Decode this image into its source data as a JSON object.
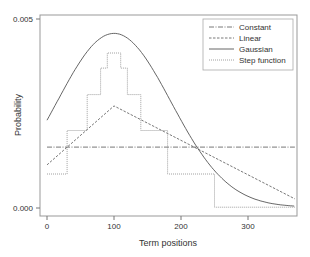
{
  "chart_data": {
    "type": "line",
    "title": "",
    "xlabel": "Term positions",
    "ylabel": "Probability",
    "xlim": [
      -10,
      370
    ],
    "ylim": [
      -0.0002,
      0.0051
    ],
    "xticks": [
      0,
      100,
      200,
      300
    ],
    "xtick_labels": [
      "0",
      "100",
      "200",
      "300"
    ],
    "yticks": [
      0.0,
      0.005
    ],
    "ytick_labels": [
      "0.000",
      "0.005"
    ],
    "grid": false,
    "legend_position": "upper right",
    "series": [
      {
        "name": "Constant",
        "style": "dashdot",
        "color": "#555555",
        "x": [
          0,
          370
        ],
        "y": [
          0.00161,
          0.00161
        ]
      },
      {
        "name": "Linear",
        "style": "dashed",
        "color": "#555555",
        "x": [
          0,
          100,
          370
        ],
        "y": [
          0.00114,
          0.0027,
          0.00024
        ]
      },
      {
        "name": "Gaussian",
        "style": "solid",
        "color": "#555555",
        "mean": 100,
        "sd": 85,
        "peak": 0.0046,
        "x": [
          0,
          25,
          50,
          75,
          100,
          125,
          150,
          175,
          200,
          225,
          250,
          275,
          300,
          325,
          350,
          370
        ],
        "y": [
          0.0019,
          0.0028,
          0.0038,
          0.0044,
          0.0046,
          0.0044,
          0.0038,
          0.0029,
          0.0019,
          0.0011,
          0.00054,
          0.00026,
          0.00012,
          6e-05,
          3e-05,
          2e-05
        ]
      },
      {
        "name": "Step function",
        "style": "dotted",
        "color": "#888888",
        "steps": [
          {
            "x0": 0,
            "x1": 30,
            "y": 0.0009
          },
          {
            "x0": 30,
            "x1": 60,
            "y": 0.00205
          },
          {
            "x0": 60,
            "x1": 80,
            "y": 0.003
          },
          {
            "x0": 80,
            "x1": 90,
            "y": 0.0037
          },
          {
            "x0": 90,
            "x1": 110,
            "y": 0.0041
          },
          {
            "x0": 110,
            "x1": 120,
            "y": 0.0037
          },
          {
            "x0": 120,
            "x1": 140,
            "y": 0.003
          },
          {
            "x0": 140,
            "x1": 180,
            "y": 0.00205
          },
          {
            "x0": 180,
            "x1": 250,
            "y": 0.0009
          },
          {
            "x0": 250,
            "x1": 370,
            "y": 2e-05
          }
        ]
      }
    ]
  },
  "legend": {
    "items": [
      "Constant",
      "Linear",
      "Gaussian",
      "Step function"
    ]
  }
}
